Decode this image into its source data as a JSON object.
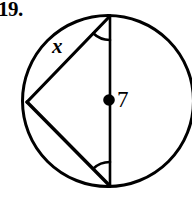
{
  "figure": {
    "problem_number": "19.",
    "caption_labels": {
      "chord_label": "x",
      "radius_label": "7"
    },
    "icons": {
      "center_point": "center-dot-icon",
      "angle_mark_top": "angle-arc-icon",
      "angle_mark_bottom": "angle-arc-icon"
    },
    "colors": {
      "stroke": "#000000",
      "background": "#ffffff"
    },
    "geometry": {
      "circle": {
        "cx": 108,
        "cy": 101,
        "r": 85.5,
        "stroke_width": 3
      },
      "center_dot": {
        "cx": 109,
        "cy": 100,
        "r": 5.5
      },
      "diameter": {
        "x1": 110,
        "y1": 15.5,
        "x2": 110,
        "y2": 186.5
      },
      "chord_upper": {
        "x1": 27,
        "y1": 102,
        "x2": 110,
        "y2": 16
      },
      "chord_lower": {
        "x1": 27,
        "y1": 102,
        "x2": 110,
        "y2": 186
      },
      "angle_arc_top": {
        "cx": 110,
        "cy": 16,
        "r": 24
      },
      "angle_arc_bottom": {
        "cx": 110,
        "cy": 186,
        "r": 24
      }
    }
  }
}
